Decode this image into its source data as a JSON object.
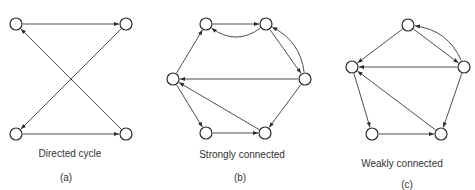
{
  "figure": {
    "colors": {
      "stroke": "#2a2a2a",
      "edge": "#3a3a3a",
      "text": "#333333",
      "background": "#ffffff"
    },
    "node_radius": 6,
    "panels": [
      {
        "id": "a",
        "caption": "Directed cycle",
        "tag": "(a)",
        "caption_pos": [
          70,
          157
        ],
        "tag_pos": [
          66,
          181
        ],
        "nodes": [
          {
            "id": "TL",
            "x": 16,
            "y": 24
          },
          {
            "id": "TR",
            "x": 126,
            "y": 24
          },
          {
            "id": "BL",
            "x": 16,
            "y": 134
          },
          {
            "id": "BR",
            "x": 126,
            "y": 134
          }
        ],
        "edges": [
          {
            "from": "TL",
            "to": "TR"
          },
          {
            "from": "BR",
            "to": "TL"
          },
          {
            "from": "TR",
            "to": "BL"
          },
          {
            "from": "BL",
            "to": "BR"
          }
        ]
      },
      {
        "id": "b",
        "caption": "Strongly connected",
        "tag": "(b)",
        "caption_pos": [
          242,
          158
        ],
        "tag_pos": [
          240,
          181
        ],
        "nodes": [
          {
            "id": "TL",
            "x": 206,
            "y": 24
          },
          {
            "id": "TR",
            "x": 266,
            "y": 24
          },
          {
            "id": "L",
            "x": 173,
            "y": 79
          },
          {
            "id": "R",
            "x": 305,
            "y": 79
          },
          {
            "id": "BL",
            "x": 206,
            "y": 133
          },
          {
            "id": "BR",
            "x": 265,
            "y": 133
          }
        ],
        "edges": [
          {
            "from": "TL",
            "to": "TR"
          },
          {
            "from": "TR",
            "to": "TL",
            "curve": -22
          },
          {
            "from": "TR",
            "to": "R"
          },
          {
            "from": "R",
            "to": "TR",
            "curve": 18
          },
          {
            "from": "R",
            "to": "L"
          },
          {
            "from": "L",
            "to": "TL"
          },
          {
            "from": "L",
            "to": "BL"
          },
          {
            "from": "BL",
            "to": "BR"
          },
          {
            "from": "BR",
            "to": "L"
          },
          {
            "from": "R",
            "to": "BR"
          }
        ]
      },
      {
        "id": "c",
        "caption": "Weakly connected",
        "tag": "(c)",
        "caption_pos": [
          402,
          167
        ],
        "tag_pos": [
          407,
          188
        ],
        "nodes": [
          {
            "id": "T",
            "x": 408,
            "y": 25
          },
          {
            "id": "L",
            "x": 352,
            "y": 67
          },
          {
            "id": "R",
            "x": 464,
            "y": 67
          },
          {
            "id": "BL",
            "x": 372,
            "y": 134
          },
          {
            "id": "BR",
            "x": 441,
            "y": 134
          }
        ],
        "edges": [
          {
            "from": "T",
            "to": "L"
          },
          {
            "from": "T",
            "to": "R"
          },
          {
            "from": "R",
            "to": "T",
            "curve": 20
          },
          {
            "from": "R",
            "to": "L"
          },
          {
            "from": "L",
            "to": "BL"
          },
          {
            "from": "BL",
            "to": "BR"
          },
          {
            "from": "BR",
            "to": "L"
          },
          {
            "from": "R",
            "to": "BR"
          }
        ]
      }
    ]
  }
}
